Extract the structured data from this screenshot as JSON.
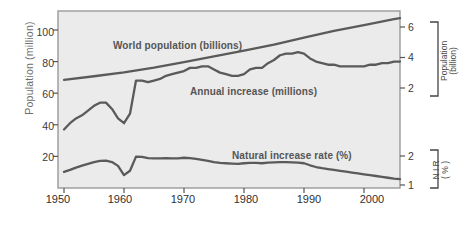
{
  "figure": {
    "background": "#ffffff",
    "plot_background": "#ebebeb",
    "line_color": "#5a5a5a",
    "frame_color": "#9a9a9a"
  },
  "axes": {
    "left": {
      "title": "Population (million)",
      "ticks": [
        "100",
        "80",
        "60",
        "40",
        "20"
      ],
      "values": [
        100,
        80,
        60,
        40,
        20
      ],
      "range": [
        0,
        112
      ]
    },
    "right_population": {
      "title_line1": "Population",
      "title_line2": "(billion)",
      "ticks": [
        "6",
        "4",
        "2"
      ],
      "values": [
        6,
        4,
        2
      ]
    },
    "right_nir": {
      "title_line1": "N I R",
      "title_line2": "( % )",
      "ticks": [
        "2",
        "1"
      ],
      "values": [
        2,
        1
      ]
    },
    "bottom": {
      "ticks": [
        "1950",
        "1960",
        "1970",
        "1980",
        "1990",
        "2000"
      ],
      "values": [
        1950,
        1960,
        1970,
        1980,
        1990,
        2000
      ],
      "range": [
        1949,
        2006
      ]
    }
  },
  "annotations": [
    {
      "name": "world-population-label",
      "text": "World population (billions)"
    },
    {
      "name": "annual-increase-label",
      "text": "Annual increase (millions)"
    },
    {
      "name": "natural-increase-rate-label",
      "text": "Natural increase rate (%)"
    }
  ],
  "chart_data": {
    "type": "line",
    "title": "",
    "xlabel": "",
    "ylabel": "Population (million)",
    "xlim": [
      1949,
      2006
    ],
    "ylim": [
      0,
      112
    ],
    "grid": false,
    "legend": "inline-annotations",
    "secondary_axes": [
      {
        "label": "Population (billion)",
        "ticks": [
          2,
          4,
          6
        ]
      },
      {
        "label": "N I R ( % )",
        "ticks": [
          1,
          2
        ]
      }
    ],
    "series": [
      {
        "name": "World population (billions)",
        "unit": "billions",
        "axis": "right_population",
        "x": [
          1950,
          1955,
          1960,
          1965,
          1970,
          1975,
          1980,
          1985,
          1990,
          1995,
          2000,
          2005,
          2006
        ],
        "values": [
          2.53,
          2.77,
          3.03,
          3.34,
          3.7,
          4.07,
          4.45,
          4.85,
          5.31,
          5.74,
          6.12,
          6.51,
          6.58
        ]
      },
      {
        "name": "Annual increase (millions)",
        "unit": "millions",
        "axis": "left",
        "x": [
          1950,
          1951,
          1952,
          1953,
          1954,
          1955,
          1956,
          1957,
          1958,
          1959,
          1960,
          1961,
          1962,
          1963,
          1964,
          1965,
          1966,
          1967,
          1968,
          1969,
          1970,
          1971,
          1972,
          1973,
          1974,
          1975,
          1976,
          1977,
          1978,
          1979,
          1980,
          1981,
          1982,
          1983,
          1984,
          1985,
          1986,
          1987,
          1988,
          1989,
          1990,
          1991,
          1992,
          1993,
          1994,
          1995,
          1996,
          1997,
          1998,
          1999,
          2000,
          2001,
          2002,
          2003,
          2004,
          2005,
          2006
        ],
        "values": [
          37,
          41,
          44,
          46,
          49,
          52,
          54,
          54,
          50,
          44,
          41,
          47,
          68,
          68,
          67,
          68,
          69,
          71,
          72,
          73,
          74,
          76,
          76,
          77,
          77,
          75,
          73,
          72,
          71,
          71,
          72,
          75,
          76,
          76,
          79,
          81,
          84,
          85,
          85,
          86,
          85,
          82,
          80,
          79,
          78,
          78,
          77,
          77,
          77,
          77,
          77,
          78,
          78,
          79,
          79,
          80,
          80
        ]
      },
      {
        "name": "Natural increase rate (%)",
        "unit": "percent",
        "axis": "right_nir",
        "x": [
          1950,
          1951,
          1952,
          1953,
          1954,
          1955,
          1956,
          1957,
          1958,
          1959,
          1960,
          1961,
          1962,
          1963,
          1964,
          1965,
          1966,
          1967,
          1968,
          1969,
          1970,
          1971,
          1972,
          1973,
          1974,
          1975,
          1976,
          1977,
          1978,
          1979,
          1980,
          1981,
          1982,
          1983,
          1984,
          1985,
          1986,
          1987,
          1988,
          1989,
          1990,
          1991,
          1992,
          1993,
          1994,
          1995,
          1996,
          1997,
          1998,
          1999,
          2000,
          2001,
          2002,
          2003,
          2004,
          2005,
          2006
        ],
        "values": [
          1.45,
          1.52,
          1.6,
          1.67,
          1.73,
          1.79,
          1.83,
          1.84,
          1.79,
          1.66,
          1.34,
          1.49,
          1.98,
          1.97,
          1.93,
          1.92,
          1.92,
          1.93,
          1.92,
          1.92,
          1.94,
          1.93,
          1.9,
          1.87,
          1.83,
          1.79,
          1.76,
          1.75,
          1.74,
          1.73,
          1.75,
          1.76,
          1.76,
          1.75,
          1.77,
          1.78,
          1.79,
          1.79,
          1.78,
          1.77,
          1.75,
          1.68,
          1.62,
          1.58,
          1.55,
          1.52,
          1.49,
          1.46,
          1.43,
          1.4,
          1.37,
          1.34,
          1.31,
          1.28,
          1.25,
          1.22,
          1.2
        ]
      }
    ]
  }
}
